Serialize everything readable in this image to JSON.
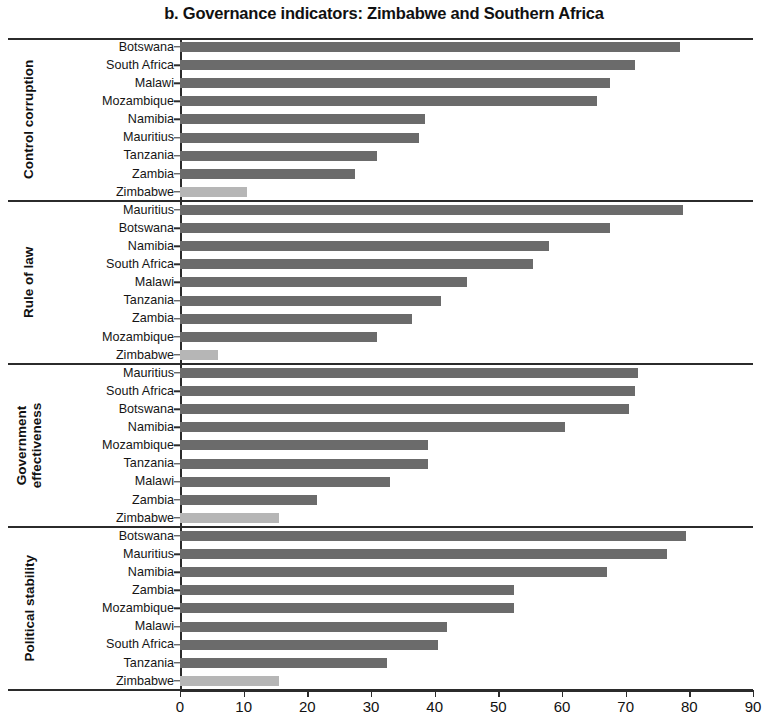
{
  "chart_data": {
    "type": "bar",
    "orientation": "horizontal",
    "title": "b. Governance indicators: Zimbabwe and Southern Africa",
    "xlabel": "",
    "ylabel": "",
    "xlim": [
      0,
      90
    ],
    "xticks": [
      0,
      10,
      20,
      30,
      40,
      50,
      60,
      70,
      80,
      90
    ],
    "xtick_labels": [
      "0",
      "10",
      "20",
      "30",
      "40",
      "50",
      "60",
      "70",
      "80",
      "90"
    ],
    "grid": false,
    "legend": "none",
    "colors": {
      "bar": "#6b6b6b",
      "highlight_bar": "#b6b6b6",
      "axis": "#2b2b2b",
      "text": "#111111",
      "background": "#ffffff"
    },
    "highlight_category": "Zimbabwe",
    "groups": [
      {
        "name": "Control corruption",
        "categories": [
          "Botswana",
          "South Africa",
          "Malawi",
          "Mozambique",
          "Namibia",
          "Mauritius",
          "Tanzania",
          "Zambia",
          "Zimbabwe"
        ],
        "values": [
          78.5,
          71.5,
          67.5,
          65.5,
          38.5,
          37.5,
          31,
          27.5,
          10.5
        ]
      },
      {
        "name": "Rule of law",
        "categories": [
          "Mauritius",
          "Botswana",
          "Namibia",
          "South Africa",
          "Malawi",
          "Tanzania",
          "Zambia",
          "Mozambique",
          "Zimbabwe"
        ],
        "values": [
          79,
          67.5,
          58,
          55.5,
          45,
          41,
          36.5,
          31,
          6
        ]
      },
      {
        "name": "Government effectiveness",
        "categories": [
          "Mauritius",
          "South Africa",
          "Botswana",
          "Namibia",
          "Mozambique",
          "Tanzania",
          "Malawi",
          "Zambia",
          "Zimbabwe"
        ],
        "values": [
          72,
          71.5,
          70.5,
          60.5,
          39,
          39,
          33,
          21.5,
          15.5
        ]
      },
      {
        "name": "Political stability",
        "categories": [
          "Botswana",
          "Mauritius",
          "Namibia",
          "Zambia",
          "Mozambique",
          "Malawi",
          "South Africa",
          "Tanzania",
          "Zimbabwe"
        ],
        "values": [
          79.5,
          76.5,
          67,
          52.5,
          52.5,
          42,
          40.5,
          32.5,
          15.5
        ]
      }
    ]
  }
}
